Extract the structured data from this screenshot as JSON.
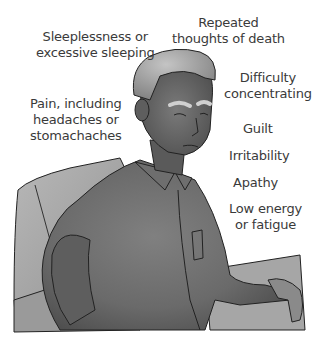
{
  "figure": {
    "colors": {
      "skin": "#6e6e6e",
      "shirt": "#777777",
      "shirt_shadow": "#4a4a4a",
      "chair": "#a8a8a8",
      "chair_shadow": "#8a8a8a",
      "hair": "#9a9a9a",
      "outline": "#222222",
      "text": "#3a3a3a"
    }
  },
  "symptoms": [
    {
      "id": "sleep",
      "lines": [
        "Sleeplessness or",
        "excessive sleeping"
      ]
    },
    {
      "id": "death",
      "lines": [
        "Repeated",
        "thoughts of death"
      ]
    },
    {
      "id": "concentration",
      "lines": [
        "Difficulty",
        "concentrating"
      ]
    },
    {
      "id": "pain",
      "lines": [
        "Pain, including",
        "headaches or",
        "stomachaches"
      ]
    },
    {
      "id": "guilt",
      "lines": [
        "Guilt"
      ]
    },
    {
      "id": "irritability",
      "lines": [
        "Irritability"
      ]
    },
    {
      "id": "apathy",
      "lines": [
        "Apathy"
      ]
    },
    {
      "id": "energy",
      "lines": [
        "Low energy",
        "or fatigue"
      ]
    }
  ]
}
